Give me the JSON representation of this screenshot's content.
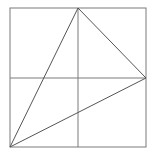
{
  "diagram": {
    "stroke_color": "#7a7a7a",
    "background": "#ffffff",
    "square": {
      "x": 10,
      "y": 8,
      "width": 136,
      "height": 139
    },
    "midlines": {
      "vertical_x": 78,
      "horizontal_y": 78
    },
    "triangle": {
      "vertices": [
        {
          "label": "top-mid",
          "x": 78,
          "y": 8
        },
        {
          "label": "right-mid",
          "x": 146,
          "y": 78
        },
        {
          "label": "bottom-left",
          "x": 10,
          "y": 147
        }
      ]
    }
  }
}
